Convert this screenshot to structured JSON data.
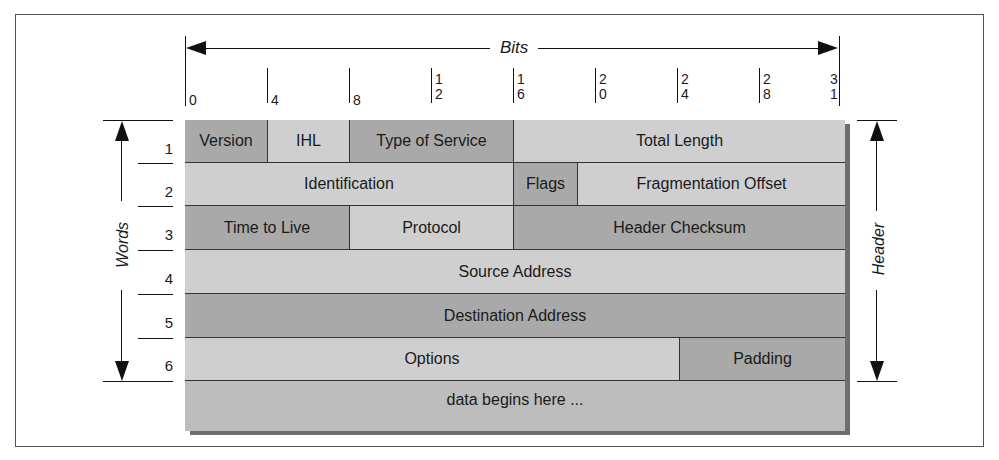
{
  "diagram": {
    "bits_axis": {
      "label": "Bits",
      "ticks": [
        {
          "bit": 0,
          "label": "0"
        },
        {
          "bit": 4,
          "label": "4"
        },
        {
          "bit": 8,
          "label": "8"
        },
        {
          "bit": 12,
          "label": "1\n2"
        },
        {
          "bit": 16,
          "label": "1\n6"
        },
        {
          "bit": 20,
          "label": "2\n0"
        },
        {
          "bit": 24,
          "label": "2\n4"
        },
        {
          "bit": 28,
          "label": "2\n8"
        },
        {
          "bit": 31,
          "label": "3\n1"
        }
      ]
    },
    "words_axis": {
      "label": "Words",
      "row_numbers": [
        "1",
        "2",
        "3",
        "4",
        "5",
        "6"
      ]
    },
    "header_axis": {
      "label": "Header"
    },
    "rows": [
      {
        "word": 1,
        "fields": [
          {
            "name": "Version",
            "start_bit": 0,
            "end_bit": 4,
            "shade": "dark"
          },
          {
            "name": "IHL",
            "start_bit": 4,
            "end_bit": 8,
            "shade": "light"
          },
          {
            "name": "Type of Service",
            "start_bit": 8,
            "end_bit": 16,
            "shade": "dark"
          },
          {
            "name": "Total Length",
            "start_bit": 16,
            "end_bit": 32,
            "shade": "light"
          }
        ]
      },
      {
        "word": 2,
        "fields": [
          {
            "name": "Identification",
            "start_bit": 0,
            "end_bit": 16,
            "shade": "light"
          },
          {
            "name": "Flags",
            "start_bit": 16,
            "end_bit": 19,
            "shade": "dark"
          },
          {
            "name": "Fragmentation Offset",
            "start_bit": 19,
            "end_bit": 32,
            "shade": "light"
          }
        ]
      },
      {
        "word": 3,
        "fields": [
          {
            "name": "Time to Live",
            "start_bit": 0,
            "end_bit": 8,
            "shade": "dark"
          },
          {
            "name": "Protocol",
            "start_bit": 8,
            "end_bit": 16,
            "shade": "light"
          },
          {
            "name": "Header Checksum",
            "start_bit": 16,
            "end_bit": 32,
            "shade": "dark"
          }
        ]
      },
      {
        "word": 4,
        "fields": [
          {
            "name": "Source Address",
            "start_bit": 0,
            "end_bit": 32,
            "shade": "light"
          }
        ]
      },
      {
        "word": 5,
        "fields": [
          {
            "name": "Destination Address",
            "start_bit": 0,
            "end_bit": 32,
            "shade": "dark"
          }
        ]
      },
      {
        "word": 6,
        "fields": [
          {
            "name": "Options",
            "start_bit": 0,
            "end_bit": 24,
            "shade": "light"
          },
          {
            "name": "Padding",
            "start_bit": 24,
            "end_bit": 32,
            "shade": "dark"
          }
        ]
      }
    ],
    "data_row": {
      "name": "data begins here ...",
      "shade": "mid"
    },
    "colors": {
      "light_field": "#cfcfcf",
      "dark_field": "#a9a9a9",
      "data_field": "#bdbdbd",
      "shadow": "#6e6e6e",
      "lines": "#333333"
    }
  }
}
